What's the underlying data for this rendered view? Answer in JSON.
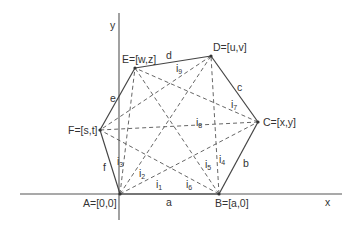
{
  "axes": {
    "x_label": "x",
    "y_label": "y",
    "color": "#555555"
  },
  "vertices": [
    {
      "id": "A",
      "label": "A=[0,0]",
      "x": 120,
      "y": 194,
      "lx": 83,
      "ly": 207
    },
    {
      "id": "B",
      "label": "B=[a,0]",
      "x": 219,
      "y": 194,
      "lx": 215,
      "ly": 207
    },
    {
      "id": "C",
      "label": "C=[x,y]",
      "x": 258,
      "y": 122,
      "lx": 263,
      "ly": 126
    },
    {
      "id": "D",
      "label": "D=[u,v]",
      "x": 211,
      "y": 56,
      "lx": 213,
      "ly": 51
    },
    {
      "id": "E",
      "label": "E=[w,z]",
      "x": 135,
      "y": 68,
      "lx": 122,
      "ly": 63
    },
    {
      "id": "F",
      "label": "F=[s,t]",
      "x": 100,
      "y": 130,
      "lx": 68,
      "ly": 134
    }
  ],
  "sides": [
    {
      "name": "a",
      "from": "A",
      "to": "B",
      "lx": 166,
      "ly": 206
    },
    {
      "name": "b",
      "from": "B",
      "to": "C",
      "lx": 243,
      "ly": 167
    },
    {
      "name": "c",
      "from": "C",
      "to": "D",
      "lx": 237,
      "ly": 91
    },
    {
      "name": "d",
      "from": "D",
      "to": "E",
      "lx": 166,
      "ly": 59
    },
    {
      "name": "e",
      "from": "E",
      "to": "F",
      "lx": 110,
      "ly": 102
    },
    {
      "name": "f",
      "from": "F",
      "to": "A",
      "lx": 103,
      "ly": 171
    }
  ],
  "diagonals": [
    {
      "name": "i",
      "sub": "1",
      "from": "A",
      "to": "C",
      "lx": 156,
      "ly": 188
    },
    {
      "name": "i",
      "sub": "2",
      "from": "A",
      "to": "D",
      "lx": 139,
      "ly": 177
    },
    {
      "name": "i",
      "sub": "3",
      "from": "A",
      "to": "E",
      "lx": 117,
      "ly": 165
    },
    {
      "name": "i",
      "sub": "4",
      "from": "B",
      "to": "D",
      "lx": 219,
      "ly": 163
    },
    {
      "name": "i",
      "sub": "5",
      "from": "B",
      "to": "E",
      "lx": 205,
      "ly": 168
    },
    {
      "name": "i",
      "sub": "6",
      "from": "B",
      "to": "F",
      "lx": 186,
      "ly": 188
    },
    {
      "name": "i",
      "sub": "7",
      "from": "C",
      "to": "E",
      "lx": 231,
      "ly": 108
    },
    {
      "name": "i",
      "sub": "8",
      "from": "C",
      "to": "F",
      "lx": 196,
      "ly": 126
    },
    {
      "name": "i",
      "sub": "9",
      "from": "D",
      "to": "F",
      "lx": 176,
      "ly": 72
    }
  ]
}
